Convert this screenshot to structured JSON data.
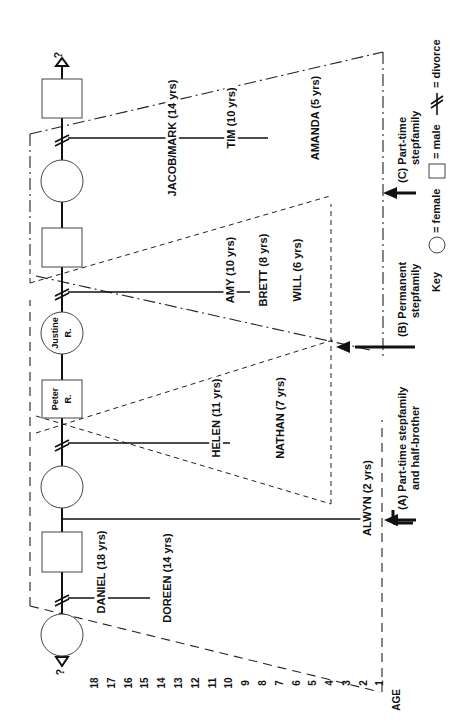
{
  "diagram": {
    "axis": {
      "label": "AGE",
      "ticks": [
        "18",
        "17",
        "16",
        "15",
        "14",
        "13",
        "12",
        "11",
        "10",
        "9",
        "8",
        "7",
        "6",
        "5",
        "4",
        "3",
        "2",
        "1"
      ]
    },
    "unknown_marker": "?",
    "people": {
      "justine": {
        "line1": "Justine",
        "line2": "R."
      },
      "peter": {
        "line1": "Peter",
        "line2": "R."
      }
    },
    "children": {
      "jacob_mark": "JACOB/MARK (14 yrs)",
      "tim": "TIM (10 yrs)",
      "amanda": "AMANDA (5 yrs)",
      "amy": "AMY (10 yrs)",
      "brett": "BRETT (8 yrs)",
      "will": "WILL (6 yrs)",
      "helen": "HELEN (11 yrs)",
      "nathan": "NATHAN (7 yrs)",
      "alwyn": "ALWYN (2 yrs)",
      "daniel": "DANIEL (18 yrs)",
      "doreen": "DOREEN (14 yrs)"
    },
    "arrows": {
      "a": {
        "line1": "(A) Part-time stepfamily",
        "line2": "and half-brother"
      },
      "b": {
        "line1": "(B) Permanent",
        "line2": "stepfamily"
      },
      "c": {
        "line1": "(C) Part-time",
        "line2": "stepfamily"
      }
    },
    "key": {
      "title": "Key",
      "female": "= female",
      "male": "= male",
      "divorce": "= divorce"
    }
  }
}
